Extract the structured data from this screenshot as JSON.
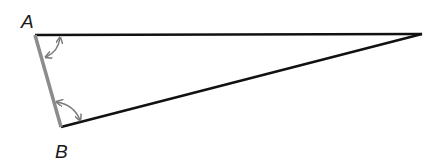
{
  "diagram": {
    "type": "triangle",
    "labels": {
      "a": "A",
      "b": "B"
    },
    "vertices": {
      "A": [
        35,
        35
      ],
      "B": [
        61,
        127
      ],
      "apex": [
        422,
        34
      ]
    },
    "colors": {
      "edge": "#111111",
      "highlight_edge": "#8c8c8c",
      "arc": "#7a7a7a"
    },
    "angle_markers": [
      {
        "at": "A",
        "style": "double-arrow-arc"
      },
      {
        "at": "B",
        "style": "double-arrow-arc"
      }
    ]
  }
}
